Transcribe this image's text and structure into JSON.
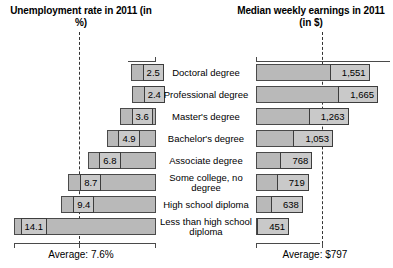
{
  "headers": {
    "left": "Unemployment rate in 2011 (in %)",
    "right": "Median weekly earnings in 2011 (in $)"
  },
  "footers": {
    "left": "Average: 7.6%",
    "right": "Average: $797"
  },
  "chart_data": {
    "type": "bar",
    "orientation": "horizontal-diverging",
    "categories": [
      "Doctoral degree",
      "Professional degree",
      "Master's degree",
      "Bachelor's degree",
      "Associate degree",
      "Some college, no degree",
      "High school diploma",
      "Less than high school diploma"
    ],
    "series": [
      {
        "name": "Unemployment rate in 2011 (in %)",
        "side": "left",
        "unit": "%",
        "values": [
          2.5,
          2.4,
          3.6,
          4.9,
          6.8,
          8.7,
          9.4,
          14.1
        ],
        "labels": [
          "2.5",
          "2.4",
          "3.6",
          "4.9",
          "6.8",
          "8.7",
          "9.4",
          "14.1"
        ],
        "average": 7.6,
        "average_label": "Average: 7.6%",
        "axis_max": 14.1
      },
      {
        "name": "Median weekly earnings in 2011 (in $)",
        "side": "right",
        "unit": "$",
        "values": [
          1551,
          1665,
          1263,
          1053,
          768,
          719,
          638,
          451
        ],
        "labels": [
          "1,551",
          "1,665",
          "1,263",
          "1,053",
          "768",
          "719",
          "638",
          "451"
        ],
        "average": 797,
        "average_label": "Average: $797",
        "axis_max": 1665
      }
    ],
    "grid": false,
    "legend": "none",
    "colors": {
      "bar_fill": "#b9b9b9",
      "bar_stroke": "#4a4a4a",
      "chip_fill": "#c9c9c9",
      "chip_stroke": "#3d3d3d",
      "average_line": "#333333",
      "text": "#000000",
      "background": "#ffffff"
    }
  }
}
